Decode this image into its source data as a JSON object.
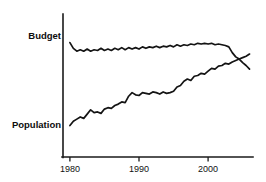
{
  "chart_data": {
    "type": "line",
    "title": "",
    "subtitle": "",
    "xlabel": "",
    "ylabel": "",
    "xlim": [
      1979,
      2006.5
    ],
    "ylim": [
      0,
      100
    ],
    "grid": false,
    "legend_position": "inline-left",
    "axes": {
      "x_ticks": [
        1980,
        1990,
        2000
      ],
      "x_tick_labels": [
        "1980",
        "1990",
        "2000"
      ],
      "y_ticks": [],
      "y_tick_labels": []
    },
    "annotations": [
      {
        "text": "Budget",
        "x": 1979,
        "y": 77,
        "align": "right"
      },
      {
        "text": "Population",
        "x": 1979,
        "y": 23,
        "align": "right"
      }
    ],
    "series": [
      {
        "name": "Budget",
        "label": "Budget",
        "color": "#141414",
        "x": [
          1980,
          1980.5,
          1981,
          1981.5,
          1982,
          1982.5,
          1983,
          1983.5,
          1984,
          1984.5,
          1985,
          1985.5,
          1986,
          1986.5,
          1987,
          1987.5,
          1988,
          1988.5,
          1989,
          1989.5,
          1990,
          1990.5,
          1991,
          1991.5,
          1992,
          1992.5,
          1993,
          1993.5,
          1994,
          1994.5,
          1995,
          1995.5,
          1996,
          1996.5,
          1997,
          1997.5,
          1998,
          1998.5,
          1999,
          1999.5,
          2000,
          2000.5,
          2001,
          2001.5,
          2002,
          2002.5,
          2003,
          2003.5,
          2004,
          2004.5,
          2005,
          2005.5,
          2006
        ],
        "values": [
          80,
          76,
          74,
          75,
          74,
          75.5,
          74,
          75,
          74.5,
          76,
          74.5,
          75.5,
          74.5,
          76,
          75,
          76.5,
          75,
          76.5,
          75.5,
          76.5,
          75.5,
          77,
          76,
          77,
          76.5,
          77.5,
          76.5,
          77.5,
          77,
          78,
          77,
          78.5,
          77.5,
          78.5,
          78,
          79,
          78.5,
          79.5,
          79,
          79.5,
          79,
          79.5,
          78.5,
          79,
          78.5,
          78,
          77,
          73,
          70,
          68.5,
          66,
          64,
          61.5
        ]
      },
      {
        "name": "Population",
        "label": "Population",
        "color": "#141414",
        "x": [
          1980,
          1980.5,
          1981,
          1981.5,
          1982,
          1982.5,
          1983,
          1983.5,
          1984,
          1984.5,
          1985,
          1985.5,
          1986,
          1986.5,
          1987,
          1987.5,
          1988,
          1988.5,
          1989,
          1989.5,
          1990,
          1990.5,
          1991,
          1991.5,
          1992,
          1992.5,
          1993,
          1993.5,
          1994,
          1994.5,
          1995,
          1995.5,
          1996,
          1996.5,
          1997,
          1997.5,
          1998,
          1998.5,
          1999,
          1999.5,
          2000,
          2000.5,
          2001,
          2001.5,
          2002,
          2002.5,
          2003,
          2003.5,
          2004,
          2004.5,
          2005,
          2005.5,
          2006
        ],
        "values": [
          22,
          25,
          26.5,
          28,
          27,
          30,
          33,
          31,
          31.5,
          30.5,
          33.5,
          34.5,
          34,
          36,
          37,
          38.5,
          38,
          42.5,
          45,
          43.5,
          43,
          45,
          44.5,
          44,
          45.5,
          45,
          44,
          45.5,
          44.5,
          45,
          46,
          49,
          50,
          53,
          54.5,
          53.5,
          56.5,
          57,
          58.5,
          58,
          60,
          62,
          61.5,
          63.5,
          64,
          65.5,
          65,
          66.5,
          67.5,
          68.5,
          69.5,
          70.5,
          72
        ]
      }
    ]
  }
}
